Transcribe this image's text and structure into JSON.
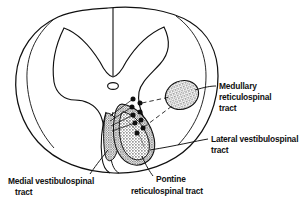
{
  "figure": {
    "background_color": "#ffffff",
    "ink_color": "#101010",
    "stipple_color": "#8a8a8a"
  },
  "labels": [
    {
      "id": "medullary-reticulospinal",
      "lines": [
        "Medullary",
        "reticulospinal",
        "tract"
      ],
      "line1": "Medullary",
      "line2": "reticulospinal",
      "line3": "tract",
      "align": "left",
      "position": "right-upper"
    },
    {
      "id": "lateral-vestibulospinal",
      "lines": [
        "Lateral vestibulospinal",
        "tract"
      ],
      "line1": "Lateral vestibulospinal",
      "line2": "tract",
      "align": "left",
      "position": "right-lower"
    },
    {
      "id": "medial-vestibulospinal",
      "lines": [
        "Medial vestibulospinal",
        "tract"
      ],
      "line1": "Medial vestibulospinal",
      "line2": "tract",
      "align": "left",
      "position": "bottom-left"
    },
    {
      "id": "pontine-reticulospinal",
      "lines": [
        "Pontine",
        "reticulospinal tract"
      ],
      "line1": "Pontine",
      "line2": "reticulospinal tract",
      "align": "center",
      "position": "bottom-center"
    }
  ],
  "regions": [
    {
      "id": "medullary-reticulospinal-region",
      "name": "Medullary reticulospinal tract",
      "shape": "oval-blob",
      "fill": "stipple",
      "location": "lateral-funiculus-posterior"
    },
    {
      "id": "lateral-vestibulospinal-region",
      "name": "Lateral vestibulospinal tract",
      "shape": "crescent",
      "fill": "stipple-dense",
      "location": "anterolateral-funiculus"
    },
    {
      "id": "pontine-reticulospinal-region",
      "name": "Pontine reticulospinal tract",
      "shape": "crescent-inner",
      "fill": "stipple-dense",
      "location": "anterior-funiculus"
    },
    {
      "id": "medial-vestibulospinal-region",
      "name": "Medial vestibulospinal tract",
      "shape": "narrow-band",
      "fill": "stipple",
      "location": "anterior-median-fissure"
    }
  ],
  "markers": {
    "name": "neuron-cell-body-dots",
    "count": 9,
    "color": "#101010"
  }
}
